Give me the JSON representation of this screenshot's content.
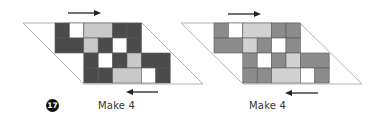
{
  "figure": {
    "step_number": "17",
    "colors": {
      "outline": "#aaaaaa",
      "cell_border": "#5a5a5a",
      "white": "#ffffff",
      "arrow": "#222222"
    },
    "cell_size": {
      "w": 14.4,
      "h": 15
    },
    "layouts": [
      {
        "id": "left",
        "caption": "Make 4",
        "dark_color": "#4b4b4b",
        "light_color": "#c9c9c9",
        "grid_origin": {
          "x": 55,
          "y": 23
        },
        "parallelogram": [
          [
            23,
            23
          ],
          [
            142,
            23
          ],
          [
            203,
            84
          ],
          [
            84,
            84
          ]
        ],
        "top_arrow": {
          "x1": 68,
          "x2": 101,
          "y": 13,
          "dir": "right"
        },
        "bottom_arrow": {
          "x1": 126,
          "x2": 158,
          "y": 92,
          "dir": "left"
        },
        "caption_pos": {
          "x": 98,
          "y": 100
        }
      },
      {
        "id": "right",
        "caption": "Make 4",
        "dark_color": "#8c8c8c",
        "light_color": "#d2d2d2",
        "grid_origin": {
          "x": 214,
          "y": 23
        },
        "parallelogram": [
          [
            181,
            23
          ],
          [
            300,
            23
          ],
          [
            362,
            84
          ],
          [
            243,
            84
          ]
        ],
        "top_arrow": {
          "x1": 228,
          "x2": 261,
          "y": 14,
          "dir": "right"
        },
        "bottom_arrow": {
          "x1": 285,
          "x2": 318,
          "y": 93,
          "dir": "left"
        },
        "caption_pos": {
          "x": 249,
          "y": 100
        }
      }
    ],
    "cells": [
      {
        "row": 0,
        "col": 0,
        "span": 1,
        "tone": "dark"
      },
      {
        "row": 0,
        "col": 1,
        "span": 1,
        "tone": "white"
      },
      {
        "row": 0,
        "col": 2,
        "span": 2,
        "tone": "light"
      },
      {
        "row": 0,
        "col": 4,
        "span": 1,
        "tone": "dark"
      },
      {
        "row": 0,
        "col": 5,
        "span": 1,
        "tone": "dark"
      },
      {
        "row": 1,
        "col": 0,
        "span": 2,
        "tone": "dark"
      },
      {
        "row": 1,
        "col": 2,
        "span": 1,
        "tone": "light"
      },
      {
        "row": 1,
        "col": 3,
        "span": 1,
        "tone": "dark"
      },
      {
        "row": 1,
        "col": 4,
        "span": 1,
        "tone": "white"
      },
      {
        "row": 1,
        "col": 5,
        "span": 1,
        "tone": "dark"
      },
      {
        "row": 2,
        "col": 2,
        "span": 1,
        "tone": "dark"
      },
      {
        "row": 2,
        "col": 3,
        "span": 1,
        "tone": "white"
      },
      {
        "row": 2,
        "col": 4,
        "span": 1,
        "tone": "dark"
      },
      {
        "row": 2,
        "col": 5,
        "span": 1,
        "tone": "light"
      },
      {
        "row": 2,
        "col": 6,
        "span": 2,
        "tone": "dark"
      },
      {
        "row": 3,
        "col": 2,
        "span": 1,
        "tone": "dark"
      },
      {
        "row": 3,
        "col": 3,
        "span": 1,
        "tone": "dark"
      },
      {
        "row": 3,
        "col": 4,
        "span": 2,
        "tone": "light"
      },
      {
        "row": 3,
        "col": 6,
        "span": 1,
        "tone": "white"
      },
      {
        "row": 3,
        "col": 7,
        "span": 1,
        "tone": "dark"
      }
    ]
  }
}
